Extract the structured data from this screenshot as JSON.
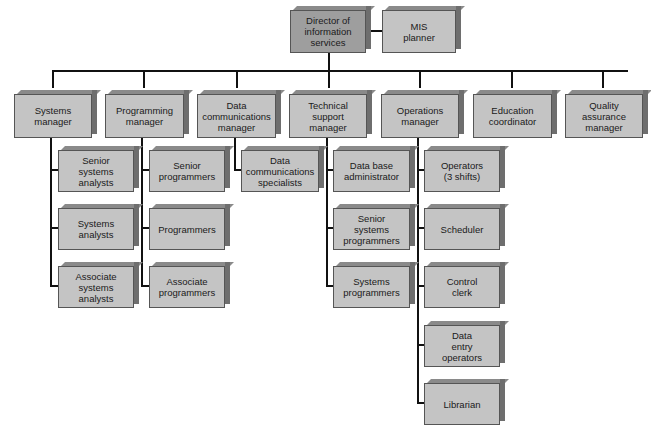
{
  "top": {
    "director": "Director of\ninformation\nservices",
    "planner": "MIS\nplanner"
  },
  "managers": [
    {
      "label": "Systems\nmanager"
    },
    {
      "label": "Programming\nmanager"
    },
    {
      "label": "Data\ncommunications\nmanager"
    },
    {
      "label": "Technical\nsupport\nmanager"
    },
    {
      "label": "Operations\nmanager"
    },
    {
      "label": "Education\ncoordinator"
    },
    {
      "label": "Quality\nassurance\nmanager"
    }
  ],
  "systems_staff": [
    "Senior\nsystems\nanalysts",
    "Systems\nanalysts",
    "Associate\nsystems\nanalysts"
  ],
  "programming_staff": [
    "Senior\nprogrammers",
    "Programmers",
    "Associate\nprogrammers"
  ],
  "datacomm_staff": [
    "Data\ncommunications\nspecialists"
  ],
  "technical_staff": [
    "Data base\nadministrator",
    "Senior\nsystems\nprogrammers",
    "Systems\nprogrammers"
  ],
  "operations_staff": [
    "Operators\n(3 shifts)",
    "Scheduler",
    "Control\nclerk",
    "Data\nentry\noperators",
    "Librarian"
  ],
  "colors": {
    "box": "#c4c4c4",
    "director_box": "#9e9e9e",
    "line": "#111111"
  }
}
